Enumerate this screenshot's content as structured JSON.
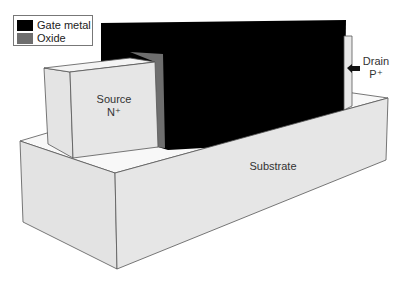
{
  "legend": {
    "items": [
      {
        "label": "Gate metal",
        "color": "#000000"
      },
      {
        "label": "Oxide",
        "color": "#6e6e6e"
      }
    ]
  },
  "labels": {
    "source": {
      "name": "Source",
      "doping": "N⁺"
    },
    "drain": {
      "name": "Drain",
      "doping": "P⁺"
    },
    "substrate": "Substrate"
  },
  "colors": {
    "gate_metal": "#000000",
    "oxide": "#6e6e6e",
    "silicon_face": "#e6e6e6",
    "silicon_top": "#f7f7f7",
    "edge": "#555555"
  }
}
